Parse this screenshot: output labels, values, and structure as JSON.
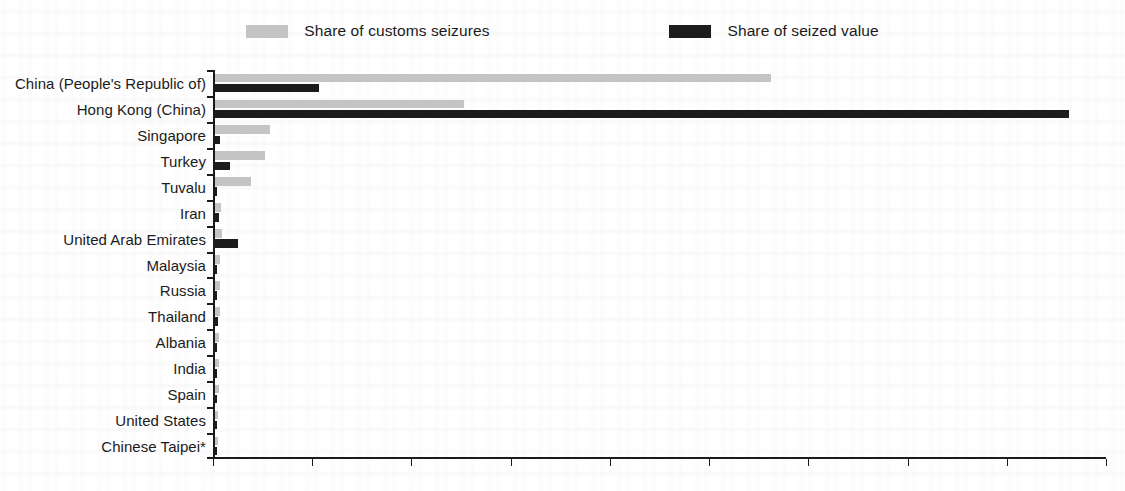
{
  "legend": {
    "entries": [
      {
        "label": "Share of customs seizures",
        "color": "#c4c4c4",
        "icon": "legend-swatch-light"
      },
      {
        "label": "Share of seized value",
        "color": "#1c1c1c",
        "icon": "legend-swatch-dark"
      }
    ]
  },
  "axis": {
    "x_ticks": [
      "0%",
      "10%",
      "20%",
      "30%",
      "40%",
      "50%",
      "60%",
      "70%",
      "80%",
      "90%"
    ]
  },
  "chart_data": {
    "type": "bar",
    "orientation": "horizontal",
    "title": "",
    "subtitle": "",
    "xlabel": "",
    "ylabel": "",
    "xlim": [
      0,
      90
    ],
    "xtick_step": 10,
    "xtick_format": "percent",
    "grid": false,
    "legend_position": "top-center",
    "footnote": "",
    "categories": [
      "China (People's Republic of)",
      "Hong Kong (China)",
      "Singapore",
      "Turkey",
      "Tuvalu",
      "Iran",
      "United Arab Emirates",
      "Malaysia",
      "Russia",
      "Thailand",
      "Albania",
      "India",
      "Spain",
      "United States",
      "Chinese Taipei*"
    ],
    "series": [
      {
        "name": "Share of customs seizures",
        "color": "#c4c4c4",
        "values": [
          56.0,
          25.1,
          5.5,
          5.0,
          3.6,
          0.6,
          0.7,
          0.5,
          0.5,
          0.5,
          0.4,
          0.4,
          0.4,
          0.3,
          0.3
        ]
      },
      {
        "name": "Share of seized value",
        "color": "#1c1c1c",
        "values": [
          10.5,
          86.1,
          0.5,
          1.5,
          0.1,
          0.4,
          2.3,
          0.2,
          0.2,
          0.3,
          0.2,
          0.2,
          0.2,
          0.2,
          0.2
        ]
      }
    ]
  }
}
